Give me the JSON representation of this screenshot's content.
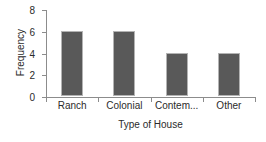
{
  "chart_data": {
    "type": "bar",
    "title": "",
    "xlabel": "Type of House",
    "ylabel": "Frequency",
    "categories": [
      "Ranch",
      "Colonial",
      "Contem...",
      "Other"
    ],
    "values": [
      6,
      6,
      4,
      4
    ],
    "yticks": [
      0,
      2,
      4,
      6,
      8
    ],
    "ylim": [
      0,
      8
    ],
    "grid": false,
    "legend": null,
    "bar_color": "#595959",
    "bar_border_color": "#b3b3b3",
    "axis_color": "#8c8c8c",
    "text_color": "#2b2b2b",
    "background": "#ffffff"
  }
}
